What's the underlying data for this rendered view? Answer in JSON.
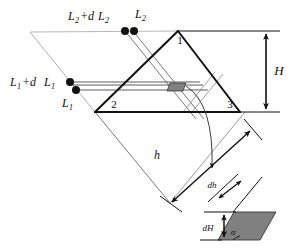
{
  "figure": {
    "type": "technical-line-diagram",
    "canvas": {
      "width": 307,
      "height": 248
    },
    "colors": {
      "line": "#111111",
      "thin_line": "#555555",
      "faint_line": "#b0b0b0",
      "shade_fill": "#808080",
      "background": "#ffffff"
    }
  },
  "labels": {
    "l2_plus_dl2": {
      "base": "L",
      "sub": "2",
      "op": "+d",
      "base2": "L",
      "sub2": "2",
      "text": "L2+dL2"
    },
    "l2": {
      "base": "L",
      "sub": "2",
      "text": "L2"
    },
    "l1_plus_dl1": {
      "base": "L",
      "sub": "1",
      "op": " +d",
      "base2": "L",
      "sub2": "1",
      "text": "L1 +dL1"
    },
    "l1": {
      "base": "L",
      "sub": "1",
      "text": "L1"
    },
    "vertex_1": "1",
    "vertex_2": "2",
    "vertex_3": "3",
    "height_H": "H",
    "slant_h": "h",
    "delta_h": "dh",
    "delta_H": "dH",
    "alpha": "α"
  },
  "geometry": {
    "triangle": {
      "apex": [
        178,
        31
      ],
      "bottom_left": [
        95,
        112
      ],
      "bottom_right": [
        240,
        112
      ]
    },
    "base_parallelogram": {
      "top_left": [
        30,
        32
      ],
      "top_right": [
        178,
        31
      ],
      "bottom_right": [
        170,
        203
      ],
      "bottom_left": [
        95,
        112
      ]
    },
    "markers": {
      "top_dots": [
        [
          125,
          31
        ],
        [
          133,
          31
        ]
      ],
      "left_dots": [
        [
          70,
          82
        ],
        [
          75,
          90
        ]
      ]
    },
    "shaded_patch_main": {
      "x": 170,
      "y": 83,
      "w": 15,
      "h": 8
    },
    "dimension_H": {
      "x": 255,
      "y_top": 31,
      "y_bottom": 112
    },
    "dimension_h": {
      "from": [
        170,
        201
      ],
      "to": [
        250,
        130
      ]
    },
    "inset": {
      "parallelogram": [
        [
          232,
          212
        ],
        [
          272,
          212
        ],
        [
          258,
          240
        ],
        [
          218,
          240
        ]
      ],
      "dH_arrow": {
        "x": 225,
        "y_top": 215,
        "y_bottom": 238
      },
      "dh_arrow": {
        "from": [
          225,
          196
        ],
        "to": [
          243,
          182
        ]
      }
    }
  }
}
